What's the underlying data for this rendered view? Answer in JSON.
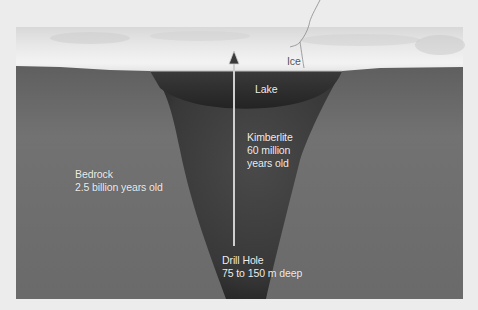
{
  "diagram": {
    "labels": {
      "ice": "Ice",
      "lake": "Lake",
      "kimberlite": [
        "Kimberlite",
        "60 million",
        "years old"
      ],
      "bedrock": [
        "Bedrock",
        "2.5 billion years old"
      ],
      "drill_hole": [
        "Drill Hole",
        "75 to 150 m deep"
      ]
    },
    "colors": {
      "background": "#ececec",
      "ice": "#e6e6e6",
      "bedrock": "#6e6e6e",
      "kimberlite": "#3f3f3f",
      "lake": "#2e2e2e",
      "drill_line": "#cfcfcf"
    }
  }
}
